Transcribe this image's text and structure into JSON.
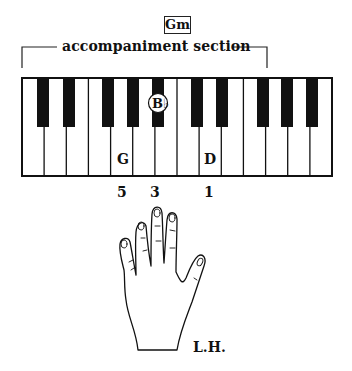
{
  "chord": {
    "name": "Gm"
  },
  "section": {
    "label": "accompaniment section"
  },
  "keyboard": {
    "white_key_count": 14,
    "black_keys_after_white_index": [
      0,
      1,
      3,
      4,
      5,
      7,
      8,
      10,
      11,
      12
    ],
    "notes": [
      {
        "label": "G",
        "key_type": "white",
        "position": "white-4"
      },
      {
        "label": "B♭",
        "key_type": "black",
        "position": "black-after-white-5",
        "circled": true
      },
      {
        "label": "D",
        "key_type": "white",
        "position": "white-8"
      }
    ]
  },
  "fingering": [
    {
      "finger": "5",
      "note": "G"
    },
    {
      "finger": "3",
      "note": "B♭"
    },
    {
      "finger": "1",
      "note": "D"
    }
  ],
  "hand": {
    "label": "L.H."
  }
}
